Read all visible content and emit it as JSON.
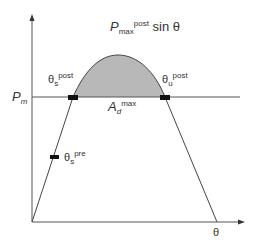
{
  "diagram": {
    "type": "power-angle-curve",
    "axes": {
      "x_label": "θ",
      "y_label_level": "P",
      "y_label_level_sub": "m"
    },
    "curve_label": {
      "main": "P",
      "sub": "max",
      "sup": "post",
      "suffix": " sin θ"
    },
    "area_label": {
      "main": "A",
      "sub": "d",
      "sup": "max"
    },
    "points": [
      {
        "id": "theta_s_post",
        "main": "θ",
        "sub": "s",
        "sup": "post"
      },
      {
        "id": "theta_u_post",
        "main": "θ",
        "sub": "u",
        "sup": "post"
      },
      {
        "id": "theta_s_pre",
        "main": "θ",
        "sub": "s",
        "sup": "pre"
      }
    ],
    "colors": {
      "line": "#444444",
      "shaded_area": "#b8b8b8",
      "marker": "#111111"
    }
  }
}
